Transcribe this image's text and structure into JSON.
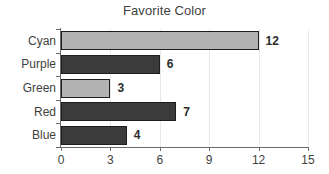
{
  "chart_data": {
    "type": "bar",
    "orientation": "horizontal",
    "title": "Favorite Color",
    "xlabel": "",
    "ylabel": "",
    "categories": [
      "Cyan",
      "Purple",
      "Green",
      "Red",
      "Blue"
    ],
    "values": [
      12,
      6,
      3,
      7,
      4
    ],
    "value_labels": [
      "12",
      "6",
      "3",
      "7",
      "4"
    ],
    "bar_styles": [
      "light",
      "dark",
      "light",
      "dark",
      "dark"
    ],
    "xlim": [
      0,
      15
    ],
    "xticks": [
      0,
      3,
      6,
      9,
      12,
      15
    ],
    "xtick_labels": [
      "0",
      "3",
      "6",
      "9",
      "12",
      "15"
    ],
    "grid": true,
    "grid_axis": "x",
    "legend": false,
    "colors": {
      "light_bar": "#b2b2b2",
      "dark_bar": "#3b3b3b",
      "bar_outline": "#1e1e1e",
      "axis": "#6b6b6b",
      "gridline": "#e9e9e9",
      "text": "#3f3f3f",
      "background": "#ffffff"
    }
  }
}
